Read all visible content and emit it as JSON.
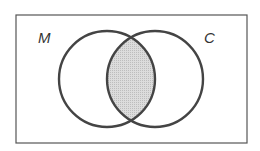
{
  "diagram": {
    "type": "venn",
    "sets": [
      {
        "label": "M",
        "cx": 107,
        "cy": 79,
        "r": 48
      },
      {
        "label": "C",
        "cx": 155,
        "cy": 79,
        "r": 48
      }
    ],
    "shaded_region": "M ∩ C",
    "colors": {
      "stroke": "#444444",
      "shade": "#d4d4d4",
      "border": "#555555",
      "background": "#ffffff"
    }
  }
}
